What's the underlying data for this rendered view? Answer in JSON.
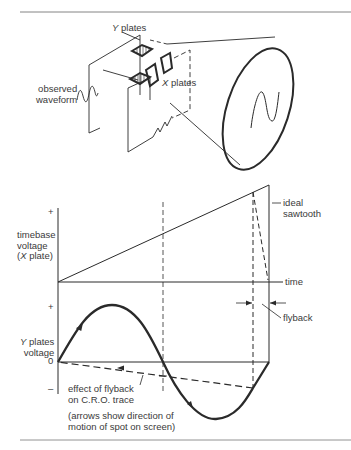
{
  "figure": {
    "top_diagram": {
      "labels": {
        "y_plates": "Y plates",
        "y_letter": "Y",
        "y_rest": " plates",
        "x_letter": "X",
        "x_rest": " plates",
        "observed_1": "observed",
        "observed_2": "waveform"
      }
    },
    "graph": {
      "timebase_label_1": "timebase",
      "timebase_label_2": "voltage",
      "timebase_label_3_open": "(",
      "timebase_label_3_x": "X",
      "timebase_label_3_rest": " plate)",
      "plus_top": "+",
      "time_label": "time",
      "ideal_1": "ideal",
      "ideal_2": "sawtooth",
      "flyback": "flyback",
      "plus_bottom": "+",
      "yplates_y": "Y",
      "yplates_rest": " plates",
      "yplates_2": "voltage",
      "zero": "0",
      "minus": "–",
      "effect_1": "effect of flyback",
      "effect_2": "on C.R.O. trace",
      "arrows_1": "(arrows show direction of",
      "arrows_2": "motion of spot on screen)"
    },
    "colors": {
      "ink": "#2a2a2a",
      "text": "#3a3a3a",
      "background": "#ffffff",
      "rule": "#555555"
    }
  }
}
